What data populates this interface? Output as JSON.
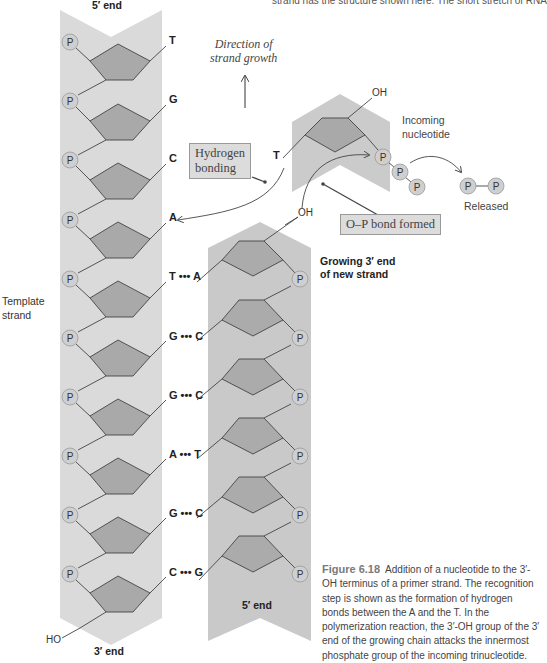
{
  "header_text": "strand has the structure shown here. The short stretch of RNA",
  "template_strand": {
    "label_line1": "Template",
    "label_line2": "strand",
    "top_end": "5′ end",
    "bottom_end": "3′ end",
    "terminal_group": "HO",
    "bases": [
      "T",
      "G",
      "C",
      "A",
      "T",
      "G",
      "G",
      "A",
      "G",
      "C"
    ]
  },
  "new_strand": {
    "top_label_line1": "Growing 3′ end",
    "top_label_line2": "of new strand",
    "bottom_end": "5′ end",
    "terminal_group": "OH",
    "pairs": [
      "T ••• A",
      "G ••• C",
      "G ••• C",
      "A ••• T",
      "G ••• C",
      "C ••• G"
    ]
  },
  "incoming": {
    "label_line1": "Incoming",
    "label_line2": "nucleotide",
    "base": "T",
    "terminal_group": "OH",
    "phosphate": "P"
  },
  "released": {
    "label": "Released",
    "phosphate": "P"
  },
  "annotations": {
    "direction_line1": "Direction of",
    "direction_line2": "strand growth",
    "hydrogen_line1": "Hydrogen",
    "hydrogen_line2": "bonding",
    "op_bond": "O–P bond formed",
    "template_pair_base": "A"
  },
  "caption": {
    "figure_label": "Figure 6.18",
    "text": "Addition of a nucleotide to the 3′-OH terminus of a primer strand. The recognition step is shown as the formation of hydrogen bonds between the A and the T. In the polymerization reaction, the 3′-OH group of the 3′ end of the growing chain attacks the innermost phosphate group of the incoming trinucleotide."
  },
  "colors": {
    "band": "#d6d6d6",
    "band_dark": "#c4c4c4",
    "sugar": "#a9a9a9",
    "phosphate": "#cfcfcf",
    "line": "#444444"
  }
}
